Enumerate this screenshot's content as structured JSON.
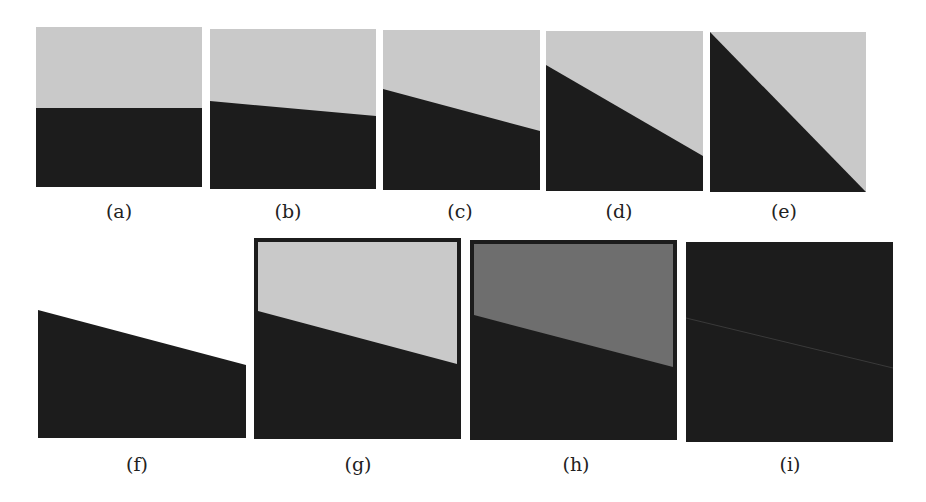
{
  "figure": {
    "colors": {
      "light": "#c9c9c9",
      "mid": "#6e6e6e",
      "dark": "#1c1c1c",
      "faint_line": "#3a3a3a"
    },
    "panels": [
      {
        "label": "(a)",
        "x": 36,
        "y": 27,
        "w": 166,
        "h": 160,
        "type": "split",
        "left_y": 81,
        "right_y": 81,
        "top": "light"
      },
      {
        "label": "(b)",
        "x": 210,
        "y": 29,
        "w": 166,
        "h": 160,
        "type": "split",
        "left_y": 72,
        "right_y": 87,
        "top": "light"
      },
      {
        "label": "(c)",
        "x": 383,
        "y": 30,
        "w": 157,
        "h": 160,
        "type": "split",
        "left_y": 59,
        "right_y": 101,
        "top": "light"
      },
      {
        "label": "(d)",
        "x": 546,
        "y": 31,
        "w": 157,
        "h": 160,
        "type": "split",
        "left_y": 34,
        "right_y": 125,
        "top": "light"
      },
      {
        "label": "(e)",
        "x": 710,
        "y": 32,
        "w": 156,
        "h": 160,
        "type": "split",
        "left_y": 0,
        "right_y": 160,
        "top": "light"
      },
      {
        "label": "(f)",
        "x": 38,
        "y": 238,
        "w": 208,
        "h": 200,
        "type": "split",
        "left_y": 72,
        "right_y": 127,
        "top": "none"
      },
      {
        "label": "(g)",
        "x": 254,
        "y": 238,
        "w": 207,
        "h": 201,
        "type": "split-border",
        "left_y": 75,
        "right_y": 127,
        "top": "light"
      },
      {
        "label": "(h)",
        "x": 470,
        "y": 240,
        "w": 207,
        "h": 200,
        "type": "split-border",
        "left_y": 75,
        "right_y": 128,
        "top": "mid"
      },
      {
        "label": "(i)",
        "x": 686,
        "y": 242,
        "w": 207,
        "h": 200,
        "type": "dark-line",
        "left_y": 76,
        "right_y": 126,
        "top": "dark"
      }
    ]
  }
}
